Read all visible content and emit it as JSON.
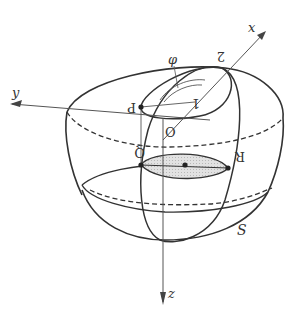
{
  "diagram": {
    "type": "3d-geometry",
    "axes": {
      "x": {
        "label": "x"
      },
      "y": {
        "label": "y"
      },
      "z": {
        "label": "z"
      }
    },
    "points": {
      "origin": "O",
      "p": "P",
      "q": "Q",
      "r": "R",
      "one": "1",
      "two": "2"
    },
    "angle_label": "φ",
    "surface_label": "S",
    "colors": {
      "stroke": "#333333",
      "axis": "#555555",
      "shade": "#d9d9d9"
    }
  }
}
